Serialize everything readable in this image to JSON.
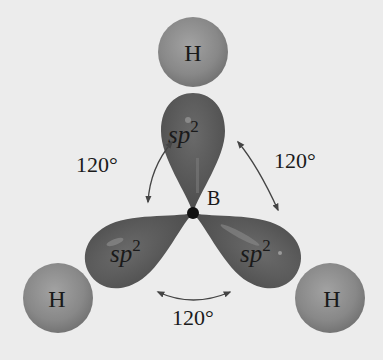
{
  "diagram": {
    "type": "molecular-orbital-geometry",
    "central_atom": {
      "label": "B"
    },
    "hydrogens": [
      {
        "id": "top",
        "label": "H"
      },
      {
        "id": "bottom-left",
        "label": "H"
      },
      {
        "id": "bottom-right",
        "label": "H"
      }
    ],
    "orbitals": [
      {
        "id": "top",
        "base": "sp",
        "superscript": "2"
      },
      {
        "id": "bottom-left",
        "base": "sp",
        "superscript": "2"
      },
      {
        "id": "bottom-right",
        "base": "sp",
        "superscript": "2"
      }
    ],
    "angles": [
      {
        "id": "upper-left",
        "label": "120°"
      },
      {
        "id": "upper-right",
        "label": "120°"
      },
      {
        "id": "bottom",
        "label": "120°"
      }
    ],
    "colors": {
      "background": "#ececec",
      "lobe": "#5a5a5a",
      "hydrogen": "#8a8a8a",
      "center_dot": "#111111"
    }
  }
}
